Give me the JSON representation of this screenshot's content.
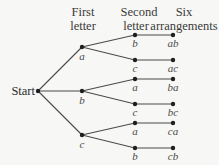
{
  "headers": {
    "first": [
      "First",
      "letter"
    ],
    "second": [
      "Second",
      "letter"
    ],
    "six": [
      "Six",
      "arrangements"
    ]
  },
  "root": {
    "label": "Start"
  },
  "tree": {
    "first_level": [
      {
        "label": "a",
        "children": [
          {
            "label": "b",
            "result": "ab"
          },
          {
            "label": "c",
            "result": "ac"
          }
        ]
      },
      {
        "label": "b",
        "children": [
          {
            "label": "a",
            "result": "ba"
          },
          {
            "label": "c",
            "result": "bc"
          }
        ]
      },
      {
        "label": "c",
        "children": [
          {
            "label": "a",
            "result": "ca"
          },
          {
            "label": "b",
            "result": "cb"
          }
        ]
      }
    ]
  }
}
